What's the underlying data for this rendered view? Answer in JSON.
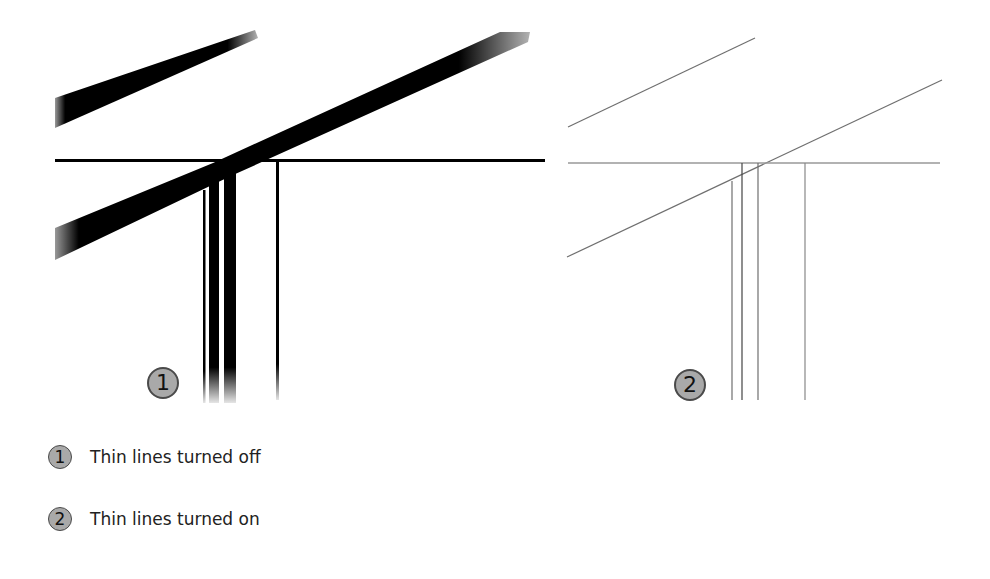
{
  "panels": [
    {
      "id": "1",
      "badge": "1",
      "description": "Thin lines turned off — lines rendered with thick line weights"
    },
    {
      "id": "2",
      "badge": "2",
      "description": "Thin lines turned on — all lines rendered at single thin weight"
    }
  ],
  "legend": {
    "items": [
      {
        "badge": "1",
        "label": "Thin lines turned off"
      },
      {
        "badge": "2",
        "label": "Thin lines turned on"
      }
    ]
  },
  "colors": {
    "badge_fill": "#a9a9a9",
    "badge_border": "#4a4a4a",
    "thick_line": "#000000",
    "thin_line": "#777777"
  }
}
